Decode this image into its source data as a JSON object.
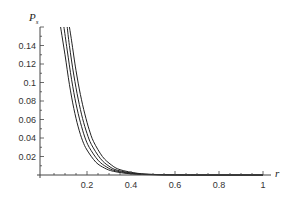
{
  "chart_data": {
    "type": "line",
    "title": "",
    "xlabel": "r",
    "ylabel": "P_s",
    "ylabel_main": "P",
    "ylabel_sub": "s",
    "xlim": [
      0,
      1.03
    ],
    "ylim": [
      0,
      0.16
    ],
    "grid": false,
    "legend": null,
    "x_ticks": [
      0.2,
      0.4,
      0.6,
      0.8,
      1
    ],
    "x_tick_labels": [
      "0.2",
      "0.4",
      "0.6",
      "0.8",
      "1"
    ],
    "y_ticks": [
      0.02,
      0.04,
      0.06,
      0.08,
      0.1,
      0.12,
      0.14
    ],
    "y_tick_labels": [
      "0.02",
      "0.04",
      "0.06",
      "0.08",
      "0.1",
      "0.12",
      "0.14"
    ],
    "line_color": "#222222",
    "series": [
      {
        "name": "curve-1",
        "x": [
          0.08,
          0.1,
          0.12,
          0.14,
          0.16,
          0.18,
          0.2,
          0.24,
          0.28,
          0.32,
          0.4,
          0.5,
          0.6,
          0.7
        ],
        "values": [
          0.16,
          0.13,
          0.098,
          0.072,
          0.052,
          0.037,
          0.027,
          0.014,
          0.0075,
          0.004,
          0.0012,
          0.0003,
          0.0001,
          0.0
        ]
      },
      {
        "name": "curve-2",
        "x": [
          0.095,
          0.11,
          0.13,
          0.15,
          0.17,
          0.19,
          0.21,
          0.25,
          0.29,
          0.33,
          0.41,
          0.5,
          0.6,
          0.7
        ],
        "values": [
          0.16,
          0.135,
          0.103,
          0.077,
          0.057,
          0.041,
          0.03,
          0.016,
          0.0085,
          0.0045,
          0.0014,
          0.0004,
          0.0001,
          0.0
        ]
      },
      {
        "name": "curve-3",
        "x": [
          0.11,
          0.12,
          0.14,
          0.16,
          0.18,
          0.2,
          0.22,
          0.26,
          0.3,
          0.34,
          0.42,
          0.5,
          0.6,
          0.7
        ],
        "values": [
          0.16,
          0.14,
          0.108,
          0.082,
          0.061,
          0.045,
          0.033,
          0.018,
          0.0095,
          0.005,
          0.0016,
          0.0005,
          0.0001,
          0.0
        ]
      },
      {
        "name": "curve-4",
        "x": [
          0.12,
          0.13,
          0.15,
          0.17,
          0.19,
          0.21,
          0.23,
          0.27,
          0.31,
          0.35,
          0.43,
          0.5,
          0.6,
          0.7
        ],
        "values": [
          0.16,
          0.145,
          0.113,
          0.087,
          0.066,
          0.049,
          0.036,
          0.02,
          0.011,
          0.0057,
          0.0018,
          0.0006,
          0.0002,
          0.0
        ]
      }
    ]
  }
}
